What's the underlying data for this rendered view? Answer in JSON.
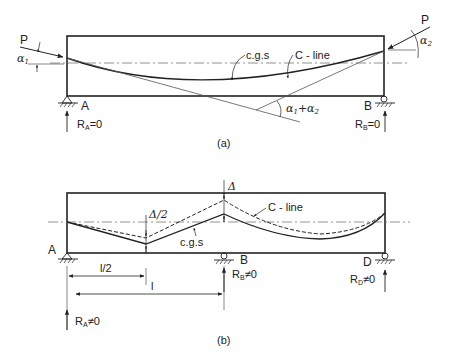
{
  "figure_a": {
    "caption": "(a)",
    "labels": {
      "force_left": "P",
      "force_right": "P",
      "alpha1": "α",
      "alpha1_sub": "1",
      "alpha2": "α",
      "alpha2_sub": "2",
      "cgs": "c.g.s",
      "c_line": "C - line",
      "sum_angle_a": "α",
      "sum_angle_sub1": "1",
      "sum_angle_plus": "+α",
      "sum_angle_sub2": "2",
      "support_a": "A",
      "support_b": "B",
      "reaction_a": "R",
      "reaction_a_sub": "A",
      "reaction_a_val": "=0",
      "reaction_b": "R",
      "reaction_b_sub": "B",
      "reaction_b_val": "=0"
    }
  },
  "figure_b": {
    "caption": "(b)",
    "labels": {
      "delta": "Δ",
      "delta_half": "Δ/2",
      "c_line": "C - line",
      "cgs": "c.g.s",
      "support_a": "A",
      "support_b": "B",
      "support_d": "D",
      "half_span": "l/2",
      "span": "l",
      "reaction_a": "R",
      "reaction_a_sub": "A",
      "reaction_a_val": "≠0",
      "reaction_b": "R",
      "reaction_b_sub": "B",
      "reaction_b_val": "≠0",
      "reaction_d": "R",
      "reaction_d_sub": "D",
      "reaction_d_val": "≠0"
    }
  },
  "colors": {
    "line": "#222222",
    "thin": "#555555",
    "background": "#ffffff"
  }
}
